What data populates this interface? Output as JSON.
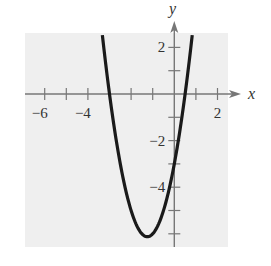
{
  "chart_data": {
    "type": "line",
    "title": "",
    "function": "f(x) = 2x^2 + 5x - 3",
    "xlabel": "x",
    "ylabel": "y",
    "xlim": [
      -7,
      3
    ],
    "ylim": [
      -6.3,
      2.6
    ],
    "x_ticks": [
      -6,
      -5,
      -4,
      -3,
      -2,
      -1,
      1,
      2
    ],
    "x_tick_labels": [
      {
        "value": -6,
        "label": "−6"
      },
      {
        "value": -4,
        "label": "−4"
      },
      {
        "value": 2,
        "label": "2"
      }
    ],
    "y_ticks": [
      2,
      1,
      -1,
      -2,
      -3,
      -4,
      -5,
      -6
    ],
    "y_tick_labels": [
      {
        "value": 2,
        "label": "2"
      },
      {
        "value": -2,
        "label": "−2"
      },
      {
        "value": -4,
        "label": "−4"
      }
    ],
    "series": [
      {
        "name": "parabola",
        "key_points": {
          "x_intercepts": [
            -3,
            0.5
          ],
          "y_intercept": -3,
          "vertex": [
            -1.25,
            -6.125
          ]
        },
        "x": [
          -3.33,
          -3,
          -2.5,
          -2,
          -1.5,
          -1.25,
          -1,
          -0.5,
          0,
          0.5,
          0.83
        ],
        "y": [
          2.5,
          0,
          -3.0,
          -5.0,
          -6.0,
          -6.125,
          -6.0,
          -5.0,
          -3.0,
          0,
          2.5
        ]
      }
    ],
    "grid": false,
    "background": "#efefef",
    "curve_color": "#1a1a1a",
    "axis_color": "#777777"
  }
}
